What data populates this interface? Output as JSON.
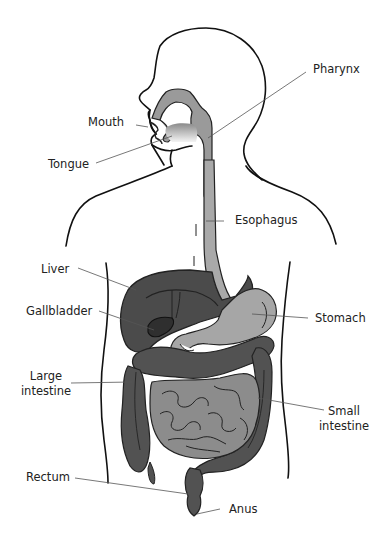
{
  "diagram": {
    "type": "anatomy",
    "colors": {
      "outline": "#111111",
      "leader_line": "#555555",
      "pharynx": "#9a9a9a",
      "esophagus": "#a9a9a9",
      "liver": "#4b4b4b",
      "gallbladder": "#2f2f2f",
      "stomach": "#a6a6a6",
      "large_intestine": "#525252",
      "small_intestine": "#8c8c8c",
      "tongue": "#bdbdbd"
    },
    "labels": [
      {
        "id": "pharynx",
        "text": "Pharynx"
      },
      {
        "id": "mouth",
        "text": "Mouth"
      },
      {
        "id": "tongue",
        "text": "Tongue"
      },
      {
        "id": "esophagus",
        "text": "Esophagus"
      },
      {
        "id": "liver",
        "text": "Liver"
      },
      {
        "id": "gallbladder",
        "text": "Gallbladder"
      },
      {
        "id": "stomach",
        "text": "Stomach"
      },
      {
        "id": "large_intestine",
        "text": "Large\nintestine",
        "line1": "Large",
        "line2": "intestine"
      },
      {
        "id": "small_intestine",
        "text": "Small\nintestine",
        "line1": "Small",
        "line2": "intestine"
      },
      {
        "id": "rectum",
        "text": "Rectum"
      },
      {
        "id": "anus",
        "text": "Anus"
      }
    ]
  }
}
